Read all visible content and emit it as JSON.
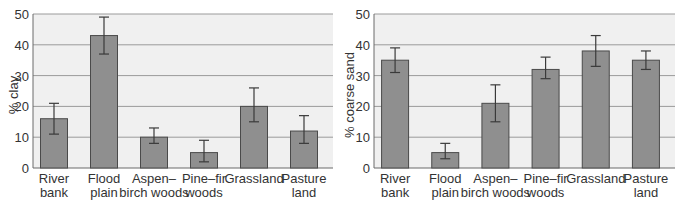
{
  "colors": {
    "plot_bg": "#f0f0f0",
    "gridline": "#9a9a9a",
    "bar_fill": "#8f8f8f",
    "bar_stroke": "#4a4a4a",
    "error_bar": "#3a3a3a",
    "axis": "#6a6a6a"
  },
  "chart_data": [
    {
      "type": "bar",
      "title": "",
      "xlabel": "",
      "ylabel": "% clay",
      "ylim": [
        0,
        50
      ],
      "yticks": [
        0,
        10,
        20,
        30,
        40,
        50
      ],
      "grid": true,
      "legend": null,
      "categories": [
        [
          "River",
          "bank"
        ],
        [
          "Flood",
          "plain"
        ],
        [
          "Aspen–",
          "birch woods"
        ],
        [
          "Pine–fir",
          "woods"
        ],
        [
          "Grassland",
          ""
        ],
        [
          "Pasture",
          "land"
        ]
      ],
      "values": [
        16,
        43,
        10,
        5,
        20,
        12
      ],
      "error_low": [
        11,
        37,
        8,
        2,
        15,
        8
      ],
      "error_high": [
        21,
        49,
        13,
        9,
        26,
        17
      ]
    },
    {
      "type": "bar",
      "title": "",
      "xlabel": "",
      "ylabel": "% coarse sand",
      "ylim": [
        0,
        50
      ],
      "yticks": [
        0,
        10,
        20,
        30,
        40,
        50
      ],
      "grid": true,
      "legend": null,
      "categories": [
        [
          "River",
          "bank"
        ],
        [
          "Flood",
          "plain"
        ],
        [
          "Aspen–",
          "birch woods"
        ],
        [
          "Pine–fir",
          "woods"
        ],
        [
          "Grassland",
          ""
        ],
        [
          "Pasture",
          "land"
        ]
      ],
      "values": [
        35,
        5,
        21,
        32,
        38,
        35
      ],
      "error_low": [
        31,
        3,
        15,
        29,
        33,
        32
      ],
      "error_high": [
        39,
        8,
        27,
        36,
        43,
        38
      ]
    }
  ]
}
